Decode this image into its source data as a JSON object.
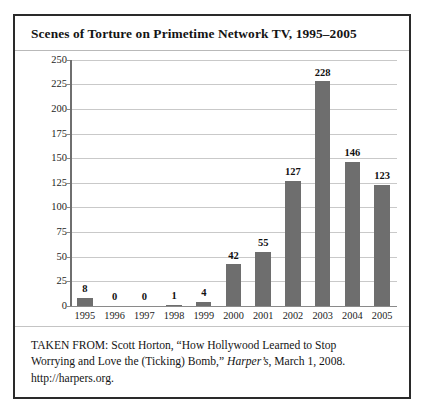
{
  "figure": {
    "title": "Scenes of Torture on Primetime Network TV, 1995–2005",
    "caption": {
      "line1_prefix": "TAKEN FROM: Scott Horton, “How Hollywood Learned to Stop",
      "line2_prefix": "Worrying and Love the (Ticking) Bomb,” ",
      "line2_italic": "Harper’s",
      "line2_suffix": ", March 1, 2008.",
      "line3": "http://harpers.org."
    }
  },
  "colors": {
    "bar_fill": "#6e6e6e",
    "gridline": "#c9c9c9",
    "axis": "#6f6f6f",
    "border": "#2a2a2a",
    "text": "#141414"
  },
  "chart_data": {
    "type": "bar",
    "title": "Scenes of Torture on Primetime Network TV, 1995–2005",
    "xlabel": "",
    "ylabel": "",
    "categories": [
      "1995",
      "1996",
      "1997",
      "1998",
      "1999",
      "2000",
      "2001",
      "2002",
      "2003",
      "2004",
      "2005"
    ],
    "values": [
      8,
      0,
      0,
      1,
      4,
      42,
      55,
      127,
      228,
      146,
      123
    ],
    "data_labels": [
      "8",
      "0",
      "0",
      "1",
      "4",
      "42",
      "55",
      "127",
      "228",
      "146",
      "123"
    ],
    "ylim": [
      0,
      250
    ],
    "ytick_step": 25,
    "yticks": [
      0,
      25,
      50,
      75,
      100,
      125,
      150,
      175,
      200,
      225,
      250
    ],
    "ytick_labels": [
      "0",
      "25",
      "50",
      "75",
      "100",
      "125",
      "150",
      "175",
      "200",
      "225",
      "250"
    ],
    "grid": true,
    "grid_axis": "y",
    "legend": false,
    "legend_position": "none"
  }
}
